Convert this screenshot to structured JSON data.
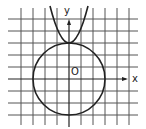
{
  "diagram": {
    "type": "coordinate-graph",
    "axes": {
      "x_label": "x",
      "y_label": "y",
      "origin_label": "O"
    },
    "grid": {
      "spacing_px": 12,
      "x_range": [
        -4,
        5
      ],
      "y_range": [
        -3,
        5
      ]
    },
    "shapes": [
      {
        "kind": "circle",
        "center": [
          0,
          0
        ],
        "radius": 3
      },
      {
        "kind": "parabola",
        "vertex": [
          0,
          3
        ],
        "opens": "up"
      }
    ],
    "colors": {
      "stroke": "#222222",
      "grid": "#555555",
      "background": "#ffffff"
    }
  }
}
